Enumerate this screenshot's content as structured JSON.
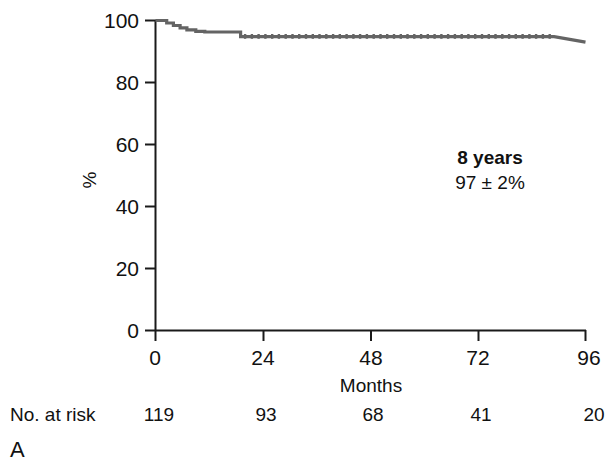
{
  "panel": {
    "letter": "A"
  },
  "risk_table": {
    "label": "No. at risk",
    "values": [
      "119",
      "93",
      "68",
      "41",
      "20"
    ]
  },
  "annotation": {
    "title": "8 years",
    "value": "97 ± 2%"
  },
  "colors": {
    "curve": "#646464",
    "axis": "#1a1a1a",
    "text": "#111111",
    "background": "#ffffff"
  },
  "chart_data": {
    "type": "line",
    "title": "",
    "subtitle": "",
    "xlabel": "Months",
    "ylabel": "%",
    "xlim": [
      0,
      96
    ],
    "ylim": [
      0,
      100
    ],
    "xticks": [
      0,
      24,
      48,
      72,
      96
    ],
    "xticklabels": [
      "0",
      "24",
      "48",
      "72",
      "96"
    ],
    "yticks": [
      0,
      20,
      40,
      60,
      80,
      100
    ],
    "yticklabels": [
      "0",
      "20",
      "40",
      "60",
      "80",
      "100"
    ],
    "grid": false,
    "legend": null,
    "annotations": [
      {
        "text_bold": "8 years",
        "text": "97 ± 2%",
        "x": 72,
        "y": 57
      }
    ],
    "series": [
      {
        "name": "Survival",
        "style": "step-post",
        "color": "#646464",
        "linewidth": 3,
        "x": [
          0,
          1.5,
          2.5,
          4,
          5.5,
          7,
          9,
          11,
          18,
          19,
          89,
          96
        ],
        "y": [
          100,
          100,
          99.2,
          98.4,
          97.6,
          97.0,
          96.5,
          96.3,
          96.3,
          94.8,
          94.8,
          93.0
        ]
      }
    ],
    "numbers_at_risk": {
      "times": [
        0,
        24,
        48,
        72,
        96
      ],
      "counts": [
        119,
        93,
        68,
        41,
        20
      ]
    }
  }
}
